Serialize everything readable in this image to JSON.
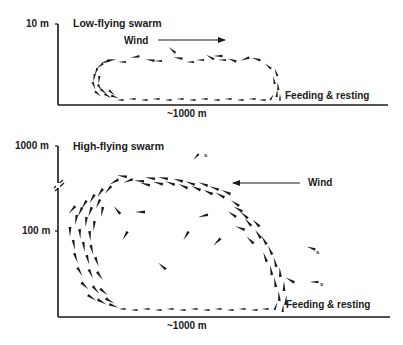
{
  "panels": [
    {
      "id": "low",
      "title": "Low-flying swarm",
      "y_tick_label": "10 m",
      "x_label": "~1000 m",
      "wind_label": "Wind",
      "wind_direction": "right",
      "ground_label": "Feeding & resting"
    },
    {
      "id": "high",
      "title": "High-flying swarm",
      "y_tick_labels": [
        "1000 m",
        "100 m"
      ],
      "axis_break": true,
      "x_label": "~1000 m",
      "wind_label": "Wind",
      "wind_direction": "left",
      "ground_label": "Feeding & resting",
      "straggler_marker": "s",
      "straggler_count": 3
    }
  ],
  "colors": {
    "ink": "#1a1a1a",
    "background": "#ffffff"
  }
}
